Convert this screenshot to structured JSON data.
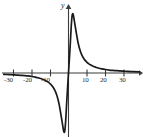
{
  "figure": {
    "background_color": "#ffffff",
    "axis_color": "#3b3b3b",
    "curve_color": "#1a1a1a",
    "y_axis_label": "y"
  },
  "chart_data": {
    "type": "line",
    "title": "",
    "xlabel": "",
    "ylabel": "y",
    "grid": false,
    "legend": null,
    "xlim": [
      -36,
      38
    ],
    "ylim": [
      -8.5,
      8.5
    ],
    "x_ticks": [
      -30,
      -20,
      -10,
      10,
      20,
      30
    ],
    "x_tick_labels": [
      "-30",
      "-20",
      "-10",
      "10",
      "20",
      "30"
    ],
    "y_ticks": [],
    "y_tick_labels": [],
    "axis_arrows": {
      "x_positive": true,
      "x_negative": false,
      "y_positive": true,
      "y_negative": false
    },
    "annotations": [],
    "series": [
      {
        "name": "curve",
        "description": "odd rational function with sharp spike near origin: minimum below axis just left of zero, steep rise through origin, maximum just right of zero, then asymptotic decay toward the x-axis on both ends",
        "x": [
          -35,
          -32,
          -30,
          -28,
          -26,
          -24,
          -22,
          -20,
          -18,
          -16,
          -15,
          -14,
          -13,
          -12,
          -11,
          -10,
          -9.5,
          -9,
          -8.5,
          -8,
          -7.5,
          -7,
          -6.5,
          -6,
          -5.5,
          -5,
          -4.6,
          -4.2,
          -3.8,
          -3.4,
          -3,
          -2.5,
          -2,
          -1.5,
          -1,
          -0.5,
          0,
          0.5,
          1,
          1.5,
          2,
          2.5,
          3,
          3.4,
          3.8,
          4.2,
          4.6,
          5,
          5.5,
          6,
          6.5,
          7,
          7.5,
          8,
          8.5,
          9,
          9.5,
          10,
          11,
          12,
          13,
          14,
          15,
          16,
          18,
          20,
          22,
          24,
          26,
          28,
          30,
          32,
          35,
          38
        ],
        "y": [
          -0.18,
          -0.21,
          -0.24,
          -0.27,
          -0.3,
          -0.34,
          -0.39,
          -0.46,
          -0.55,
          -0.66,
          -0.73,
          -0.82,
          -0.92,
          -1.05,
          -1.2,
          -1.4,
          -1.52,
          -1.66,
          -1.82,
          -2.0,
          -2.22,
          -2.48,
          -2.8,
          -3.18,
          -3.65,
          -4.2,
          -4.75,
          -5.3,
          -5.9,
          -6.5,
          -7.1,
          -7.75,
          -7.6,
          -6.2,
          -4.0,
          -1.9,
          0,
          1.9,
          4.0,
          6.2,
          7.6,
          7.75,
          7.1,
          6.5,
          5.9,
          5.3,
          4.75,
          4.2,
          3.65,
          3.18,
          2.8,
          2.48,
          2.22,
          2.0,
          1.82,
          1.66,
          1.52,
          1.4,
          1.2,
          1.05,
          0.92,
          0.82,
          0.73,
          0.66,
          0.55,
          0.46,
          0.39,
          0.34,
          0.3,
          0.27,
          0.24,
          0.21,
          0.18,
          0.16
        ]
      }
    ]
  },
  "labels": {
    "x_tick_0": "-30",
    "x_tick_1": "-20",
    "x_tick_2": "-10",
    "x_tick_3": "10",
    "x_tick_4": "20",
    "x_tick_5": "30"
  }
}
